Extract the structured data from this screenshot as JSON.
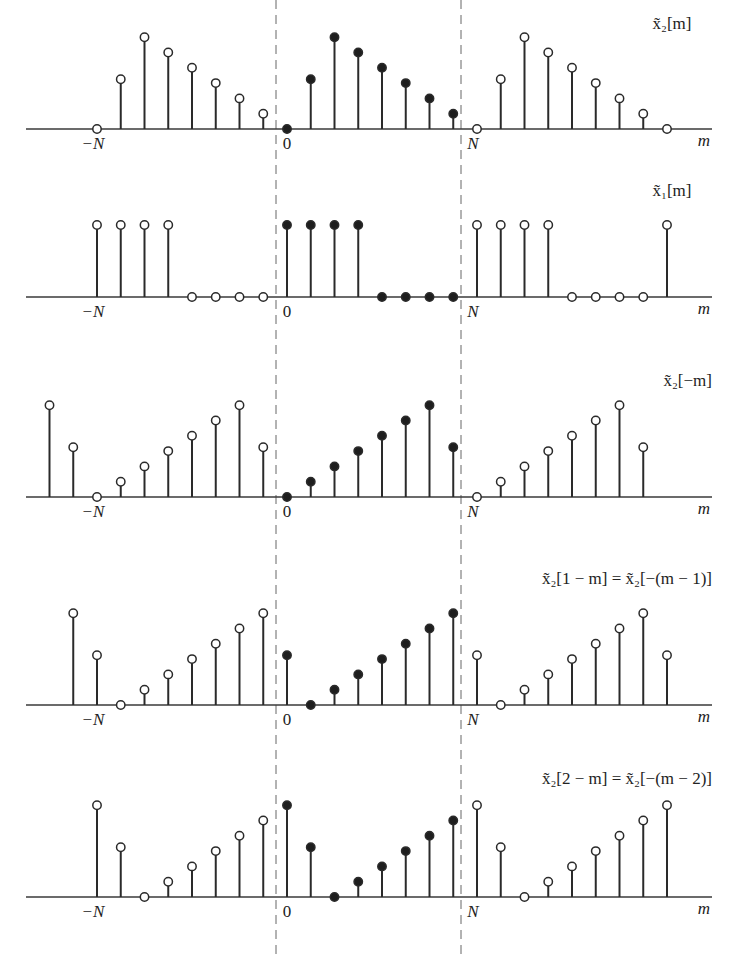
{
  "chart_data": {
    "type": "stem",
    "period_N": 8,
    "m_range": [
      -10,
      16
    ],
    "period_markers": {
      "labels": [
        "-N",
        "0",
        "N"
      ],
      "dashed_lines_at": [
        "-0.5",
        "N-0.5"
      ]
    },
    "panels": [
      {
        "id": "x2_m",
        "label": "x̃₂[m]",
        "label_text": "~x2[m]",
        "xlabel": "m",
        "one_period_values_m0_to_7": [
          0,
          3.25,
          6,
          5,
          4,
          3,
          2,
          1
        ],
        "highlighted_period": "0..N-1 (filled markers)"
      },
      {
        "id": "x1_m",
        "label": "x̃₁[m]",
        "label_text": "~x1[m]",
        "xlabel": "m",
        "one_period_values_m0_to_7": [
          1,
          1,
          1,
          1,
          0,
          0,
          0,
          0
        ],
        "highlighted_period": "0..N-1 (filled markers)"
      },
      {
        "id": "x2_neg_m",
        "label": "x̃₂[−m]",
        "label_text": "~x2[-m]",
        "xlabel": "m",
        "one_period_values_m0_to_7": [
          0,
          1,
          2,
          3,
          4,
          5,
          6,
          3.25
        ],
        "highlighted_period": "0..N-1 (filled markers)"
      },
      {
        "id": "x2_1_minus_m",
        "label": "x̃₂[1 − m] = x̃₂[−(m − 1)]",
        "label_text": "~x2[1-m] = ~x2[-(m-1)]",
        "xlabel": "m",
        "one_period_values_m0_to_7": [
          3.25,
          0,
          1,
          2,
          3,
          4,
          5,
          6
        ],
        "highlighted_period": "0..N-1 (filled markers)"
      },
      {
        "id": "x2_2_minus_m",
        "label": "x̃₂[2 − m] = x̃₂[−(m − 2)]",
        "label_text": "~x2[2-m] = ~x2[-(m-2)]",
        "xlabel": "m",
        "one_period_values_m0_to_7": [
          6,
          3.25,
          0,
          1,
          2,
          3,
          4,
          5
        ],
        "highlighted_period": "0..N-1 (filled markers)"
      }
    ]
  },
  "layout": {
    "x_origin_px": 287,
    "sample_spacing_px": 23.75,
    "unit_height_px": 15.3,
    "x1_height_px": 72,
    "dashed_x_px": [
      276,
      461
    ],
    "baselines_px": [
      129,
      297,
      497,
      705,
      897
    ],
    "panel_m_ranges": [
      [
        -8,
        16
      ],
      [
        -8,
        16
      ],
      [
        -10,
        15
      ],
      [
        -9,
        16
      ],
      [
        -8,
        16
      ]
    ]
  },
  "axis_labels": {
    "minus_N": "−N",
    "zero": "0",
    "N": "N",
    "m": "m"
  },
  "panel_titles": {
    "p1": "x̃₂[m]",
    "p2": "x̃₁[m]",
    "p3": "x̃₂[−m]",
    "p4": "x̃₂[1 − m] = x̃₂[−(m − 1)]",
    "p5": "x̃₂[2 − m] = x̃₂[−(m − 2)]"
  },
  "colors": {
    "stem": "#2a2a2a",
    "axis": "#3a3a3a",
    "filled_marker": "#1e1e1e",
    "open_marker_fill": "#ffffff",
    "dashed": "#666666"
  }
}
